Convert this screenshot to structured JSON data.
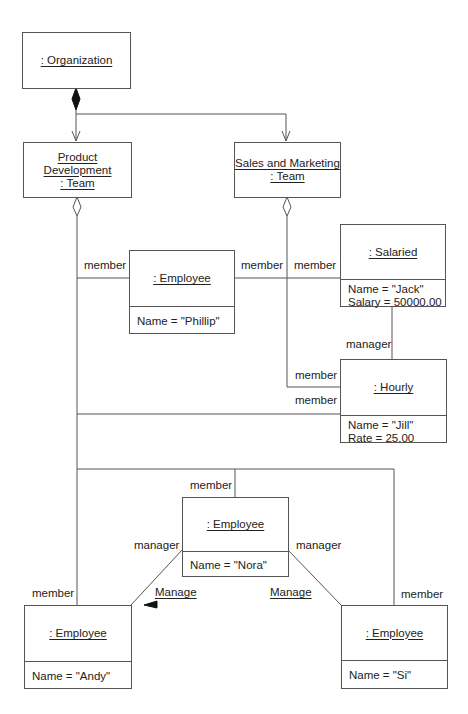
{
  "diagram": {
    "type": "UML object diagram",
    "objects": {
      "organization": {
        "name": ": Organization"
      },
      "product_development": {
        "name_line1": "Product Development",
        "name_line2": ": Team"
      },
      "sales_marketing": {
        "name_line1": "Sales and Marketing",
        "name_line2": ": Team"
      },
      "phillip": {
        "name": ": Employee",
        "attrs": [
          "Name = \"Phillip\""
        ]
      },
      "salaried": {
        "name": ": Salaried",
        "attrs": [
          "Name = \"Jack\"",
          "Salary = 50000.00"
        ]
      },
      "hourly": {
        "name": ": Hourly",
        "attrs": [
          "Name = \"Jill\"",
          "Rate = 25.00"
        ]
      },
      "nora": {
        "name": ": Employee",
        "attrs": [
          "Name = \"Nora\""
        ]
      },
      "andy": {
        "name": ": Employee",
        "attrs": [
          "Name = \"Andy\""
        ]
      },
      "si": {
        "name": ": Employee",
        "attrs": [
          "Name = \"Si\""
        ]
      }
    },
    "role_labels": {
      "pd_phillip_member": "member",
      "phillip_salaried_member": "member",
      "sm_salaried_member": "member",
      "salaried_hourly_manager": "manager",
      "sm_hourly_member": "member",
      "pd_hourly_member": "member",
      "nora_member": "member",
      "nora_manager_left": "manager",
      "nora_manager_right": "manager",
      "andy_member": "member",
      "si_member": "member"
    },
    "link_names": {
      "manage_left": "Manage",
      "manage_right": "Manage"
    },
    "caption": ""
  },
  "colors": {
    "line": "#555555",
    "text": "#222222",
    "background": "#ffffff"
  }
}
